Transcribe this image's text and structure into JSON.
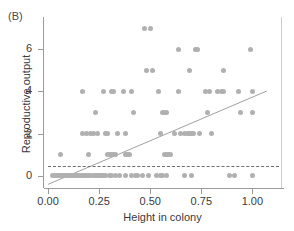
{
  "panel": {
    "label": "(B)"
  },
  "chart_data": {
    "type": "scatter",
    "title": "",
    "xlabel": "Height in colony",
    "ylabel": "Reproductive output",
    "xlim": [
      -0.02,
      1.14
    ],
    "ylim": [
      -0.45,
      7.4
    ],
    "xticks": [
      0.0,
      0.25,
      0.5,
      0.75,
      1.0
    ],
    "xticklabels": [
      "0.00",
      "0.25",
      "0.50",
      "0.75",
      "1.00"
    ],
    "yticks": [
      0,
      2,
      4,
      6
    ],
    "yticklabels": [
      "0",
      "2",
      "4",
      "6"
    ],
    "grid": false,
    "legend": null,
    "point_color": "#b0b0b0",
    "line_color": "#a0a0a0",
    "hline_color": "#6d6d6d",
    "fit_line": {
      "type": "linear-regression",
      "x0": 0.0,
      "y0": -0.42,
      "x1": 1.07,
      "y1": 4.02
    },
    "threshold_line": {
      "type": "horizontal-dashed",
      "y": 0.45,
      "x_start": 0.0,
      "x_end": 1.13
    },
    "points": [
      [
        0.06,
        1
      ],
      [
        0.17,
        4
      ],
      [
        0.17,
        2
      ],
      [
        0.19,
        2
      ],
      [
        0.2,
        1
      ],
      [
        0.21,
        2
      ],
      [
        0.22,
        2
      ],
      [
        0.23,
        3
      ],
      [
        0.24,
        2
      ],
      [
        0.27,
        4
      ],
      [
        0.28,
        2
      ],
      [
        0.29,
        2
      ],
      [
        0.29,
        1
      ],
      [
        0.3,
        1
      ],
      [
        0.31,
        1
      ],
      [
        0.31,
        4
      ],
      [
        0.32,
        4
      ],
      [
        0.32,
        1
      ],
      [
        0.33,
        1
      ],
      [
        0.34,
        2
      ],
      [
        0.37,
        4
      ],
      [
        0.38,
        2
      ],
      [
        0.38,
        1
      ],
      [
        0.39,
        1
      ],
      [
        0.4,
        1
      ],
      [
        0.41,
        4
      ],
      [
        0.42,
        3
      ],
      [
        0.47,
        7
      ],
      [
        0.48,
        5
      ],
      [
        0.5,
        7
      ],
      [
        0.51,
        5
      ],
      [
        0.54,
        4
      ],
      [
        0.55,
        2
      ],
      [
        0.56,
        3
      ],
      [
        0.57,
        3
      ],
      [
        0.57,
        1
      ],
      [
        0.58,
        3
      ],
      [
        0.58,
        1
      ],
      [
        0.59,
        1
      ],
      [
        0.6,
        1
      ],
      [
        0.62,
        2
      ],
      [
        0.64,
        6
      ],
      [
        0.64,
        4
      ],
      [
        0.65,
        2
      ],
      [
        0.67,
        2
      ],
      [
        0.68,
        2
      ],
      [
        0.69,
        5
      ],
      [
        0.69,
        2
      ],
      [
        0.7,
        2
      ],
      [
        0.71,
        2
      ],
      [
        0.72,
        6
      ],
      [
        0.73,
        6
      ],
      [
        0.74,
        2
      ],
      [
        0.77,
        4
      ],
      [
        0.78,
        3
      ],
      [
        0.79,
        4
      ],
      [
        0.8,
        2
      ],
      [
        0.83,
        4
      ],
      [
        0.85,
        4
      ],
      [
        0.86,
        5
      ],
      [
        0.86,
        4
      ],
      [
        0.93,
        4
      ],
      [
        0.94,
        3
      ],
      [
        0.99,
        6
      ],
      [
        1.0,
        4
      ],
      [
        1.0,
        3
      ],
      [
        0.02,
        0
      ],
      [
        0.03,
        0
      ],
      [
        0.04,
        0
      ],
      [
        0.05,
        0
      ],
      [
        0.06,
        0
      ],
      [
        0.07,
        0
      ],
      [
        0.08,
        0
      ],
      [
        0.09,
        0
      ],
      [
        0.1,
        0
      ],
      [
        0.11,
        0
      ],
      [
        0.12,
        0
      ],
      [
        0.13,
        0
      ],
      [
        0.14,
        0
      ],
      [
        0.15,
        0
      ],
      [
        0.16,
        0
      ],
      [
        0.17,
        0
      ],
      [
        0.18,
        0
      ],
      [
        0.19,
        0
      ],
      [
        0.2,
        0
      ],
      [
        0.21,
        0
      ],
      [
        0.22,
        0
      ],
      [
        0.23,
        0
      ],
      [
        0.24,
        0
      ],
      [
        0.25,
        0
      ],
      [
        0.26,
        0
      ],
      [
        0.27,
        0
      ],
      [
        0.28,
        0
      ],
      [
        0.3,
        0
      ],
      [
        0.31,
        0
      ],
      [
        0.33,
        0
      ],
      [
        0.35,
        0
      ],
      [
        0.38,
        0
      ],
      [
        0.41,
        0
      ],
      [
        0.43,
        0
      ],
      [
        0.44,
        0
      ],
      [
        0.46,
        0
      ],
      [
        0.49,
        0
      ],
      [
        0.53,
        0
      ],
      [
        0.55,
        0
      ],
      [
        0.56,
        0
      ],
      [
        0.58,
        0
      ],
      [
        0.67,
        0
      ],
      [
        0.7,
        0
      ],
      [
        0.89,
        0
      ],
      [
        0.91,
        0
      ],
      [
        1.0,
        0
      ]
    ]
  }
}
